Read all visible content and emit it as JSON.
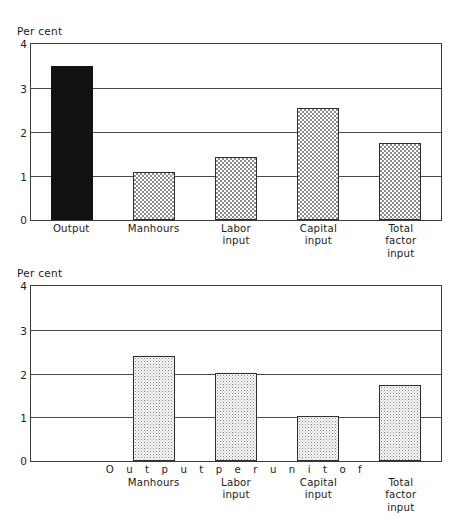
{
  "chart_data": [
    {
      "type": "bar",
      "id": "top",
      "title": "",
      "ylabel": "Per cent",
      "xlabel": "",
      "ylim": [
        0,
        4
      ],
      "yticks": [
        0,
        1,
        2,
        3,
        4
      ],
      "ytick_labels": [
        "0",
        "1",
        "2",
        "3",
        "4"
      ],
      "grid": true,
      "grid_axis": "y",
      "legend": false,
      "categories": [
        "Output",
        "Manhours",
        "Labor input",
        "Capital input",
        "Total factor input"
      ],
      "category_lines": [
        [
          "Output"
        ],
        [
          "Manhours"
        ],
        [
          "Labor",
          "input"
        ],
        [
          "Capital",
          "input"
        ],
        [
          "Total",
          "factor",
          "input"
        ]
      ],
      "values": [
        3.5,
        1.1,
        1.43,
        2.55,
        1.75
      ],
      "fills": [
        "solid-black",
        "checkerboard",
        "checkerboard",
        "checkerboard",
        "checkerboard"
      ]
    },
    {
      "type": "bar",
      "id": "bottom",
      "title": "",
      "ylabel": "Per cent",
      "xlabel": "Output per unit of",
      "xlabel_spaced": "O u t p u t   p e r   u n i t   o f",
      "ylim": [
        0,
        4
      ],
      "yticks": [
        0,
        1,
        2,
        3,
        4
      ],
      "ytick_labels": [
        "0",
        "1",
        "2",
        "3",
        "4"
      ],
      "grid": true,
      "grid_axis": "y",
      "legend": false,
      "categories": [
        "Manhours",
        "Labor input",
        "Capital input",
        "Total factor input"
      ],
      "category_lines": [
        [
          "Manhours"
        ],
        [
          "Labor",
          "input"
        ],
        [
          "Capital",
          "input"
        ],
        [
          "Total",
          "factor",
          "input"
        ]
      ],
      "values": [
        2.4,
        2.02,
        1.02,
        1.73
      ],
      "fills": [
        "stipple",
        "stipple",
        "stipple",
        "stipple"
      ],
      "bar_slots": [
        1,
        2,
        3,
        4
      ],
      "slot_count": 5
    }
  ],
  "colors": {
    "ink": "#1c1c1c",
    "frame": "#3a3a3a",
    "grid": "#4a4a4a",
    "bar_solid": "#121212",
    "bar_pattern": "#8d8d8d",
    "background": "#ffffff"
  }
}
